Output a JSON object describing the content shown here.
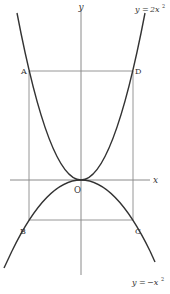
{
  "figure": {
    "axes": {
      "x_label": "x",
      "y_label": "y",
      "origin_label": "O"
    },
    "curves": [
      {
        "name": "upper-parabola",
        "equation": "y = 2x²",
        "label_lhs": "y",
        "label_eq": "=",
        "label_rhs": "2x",
        "label_exp": "2"
      },
      {
        "name": "lower-parabola",
        "equation": "y = −x²",
        "label_lhs": "y",
        "label_eq": "=",
        "label_rhs": "−x",
        "label_exp": "2"
      }
    ],
    "points": {
      "A": "A",
      "B": "B",
      "C": "C",
      "D": "D"
    },
    "rectangle": [
      "A",
      "B",
      "C",
      "D"
    ],
    "colors": {
      "curve": "#333333",
      "axis": "#777777",
      "rect": "#888888",
      "text": "#333333"
    }
  }
}
